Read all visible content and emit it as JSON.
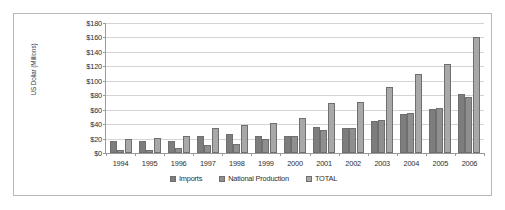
{
  "chart_data": {
    "type": "bar",
    "title": "",
    "xlabel": "",
    "ylabel": "US Dollar (Millions)",
    "ylim": [
      0,
      180
    ],
    "ytick_step": 20,
    "ytick_labels": [
      "$180",
      "$160",
      "$140",
      "$120",
      "$100",
      "$80",
      "$60",
      "$40",
      "$20",
      "$0"
    ],
    "grid": true,
    "legend_position": "bottom",
    "categories": [
      "1994",
      "1995",
      "1996",
      "1997",
      "1998",
      "1999",
      "2000",
      "2001",
      "2002",
      "2003",
      "2004",
      "2005",
      "2006"
    ],
    "series": [
      {
        "name": "Imports",
        "color": "#7d7d7d",
        "values": [
          16,
          17,
          17,
          23,
          26,
          23,
          24,
          36,
          35,
          44,
          54,
          61,
          82
        ]
      },
      {
        "name": "National Production",
        "color": "#8f8f8f",
        "values": [
          4,
          4,
          7,
          11,
          13,
          20,
          24,
          32,
          35,
          46,
          55,
          62,
          78
        ]
      },
      {
        "name": "TOTAL",
        "color": "#a8a8a8",
        "values": [
          20,
          21,
          24,
          34,
          39,
          42,
          48,
          69,
          70,
          91,
          109,
          123,
          160
        ]
      }
    ]
  },
  "legend": {
    "items": [
      {
        "label": "Imports"
      },
      {
        "label": "National Production"
      },
      {
        "label": "TOTAL"
      }
    ]
  }
}
